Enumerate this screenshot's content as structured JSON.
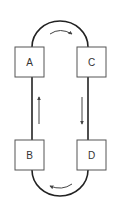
{
  "diagram": {
    "type": "cycle-flow",
    "colors": {
      "line": "#222222",
      "box_stroke": "#555555",
      "box_fill": "#ffffff",
      "arrow": "#444444",
      "text": "#333333"
    },
    "nodes": [
      {
        "id": "A",
        "label": "A",
        "position": "top-left"
      },
      {
        "id": "C",
        "label": "C",
        "position": "top-right"
      },
      {
        "id": "B",
        "label": "B",
        "position": "bottom-left"
      },
      {
        "id": "D",
        "label": "D",
        "position": "bottom-right"
      }
    ],
    "edges": [
      {
        "from": "A",
        "to": "C",
        "shape": "arc-top",
        "direction": "clockwise"
      },
      {
        "from": "C",
        "to": "D",
        "shape": "straight",
        "direction": "down"
      },
      {
        "from": "D",
        "to": "B",
        "shape": "arc-bottom",
        "direction": "clockwise"
      },
      {
        "from": "B",
        "to": "A",
        "shape": "straight",
        "direction": "up"
      }
    ]
  }
}
